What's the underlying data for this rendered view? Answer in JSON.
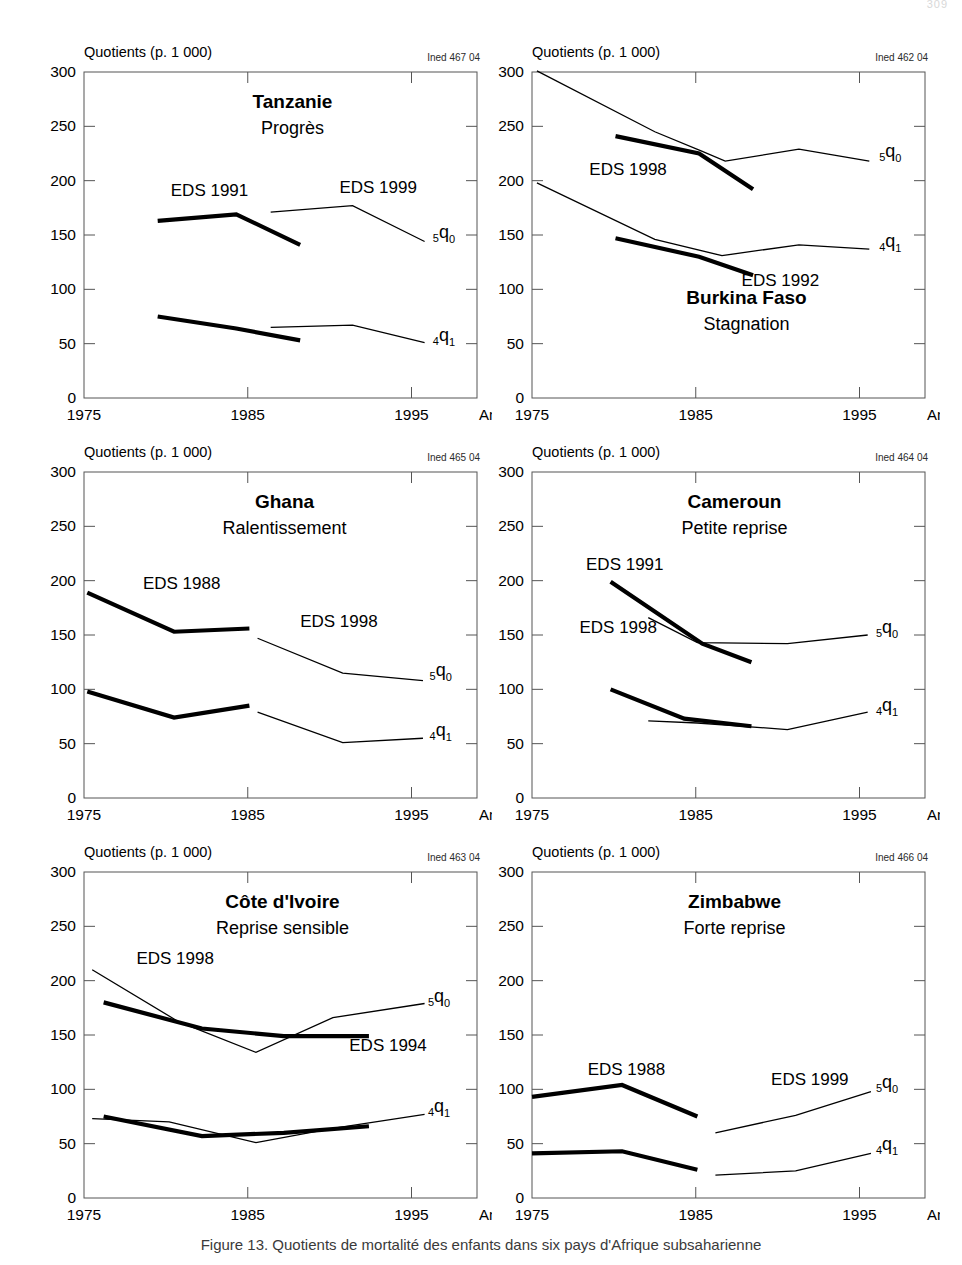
{
  "page": {
    "page_number": "309"
  },
  "caption": "Figure 13.  Quotients de mortalité des enfants dans six pays d'Afrique subsaharienne",
  "axis": {
    "y_axis_title": "Quotients (p. 1 000)",
    "x_axis_title": "Année",
    "y_ticks": [
      "0",
      "50",
      "100",
      "150",
      "200",
      "250",
      "300"
    ],
    "y_tick_values": [
      0,
      50,
      100,
      150,
      200,
      250,
      300
    ],
    "x_ticks": [
      "1975",
      "1985",
      "1995"
    ],
    "x_tick_values": [
      1975,
      1985,
      1995
    ],
    "xlim": [
      1975,
      1999
    ],
    "ylim": [
      0,
      300
    ]
  },
  "series_labels": {
    "q5": "5q0",
    "q4": "4q1"
  },
  "chart_data": [
    {
      "type": "line",
      "title": "Tanzanie",
      "subtitle": "Progrès",
      "ined_code": "Ined 467 04",
      "xlabel": "Année",
      "ylabel": "Quotients (p. 1 000)",
      "xlim": [
        1975,
        1999
      ],
      "ylim": [
        0,
        300
      ],
      "grid": false,
      "legend_position": "inline-annotations",
      "annotations": [
        {
          "text": "EDS 1991",
          "x": 1980.3,
          "y": 186
        },
        {
          "text": "EDS 1999",
          "x": 1990.6,
          "y": 189
        },
        {
          "text": "5q0",
          "x": 1996.3,
          "y": 147
        },
        {
          "text": "4q1",
          "x": 1996.3,
          "y": 52
        }
      ],
      "series": [
        {
          "name": "EDS 1991 — 5q0",
          "weight": "bold",
          "x": [
            1979.5,
            1984.3,
            1988.2
          ],
          "values": [
            163,
            169,
            141
          ]
        },
        {
          "name": "EDS 1991 — 4q1",
          "weight": "bold",
          "x": [
            1979.5,
            1984.3,
            1988.2
          ],
          "values": [
            75,
            64,
            53
          ]
        },
        {
          "name": "EDS 1999 — 5q0",
          "weight": "thin",
          "x": [
            1986.4,
            1991.4,
            1995.8
          ],
          "values": [
            171,
            177,
            144
          ]
        },
        {
          "name": "EDS 1999 — 4q1",
          "weight": "thin",
          "x": [
            1986.4,
            1991.4,
            1995.8
          ],
          "values": [
            65,
            67,
            51
          ]
        }
      ]
    },
    {
      "type": "line",
      "title": "Burkina Faso",
      "subtitle": "Stagnation",
      "ined_code": "Ined 462 04",
      "xlabel": "Année",
      "ylabel": "Quotients (p. 1 000)",
      "xlim": [
        1975,
        1999
      ],
      "ylim": [
        0,
        300
      ],
      "grid": false,
      "legend_position": "inline-annotations",
      "annotations": [
        {
          "text": "EDS 1998",
          "x": 1978.5,
          "y": 205
        },
        {
          "text": "EDS 1992",
          "x": 1987.8,
          "y": 103
        },
        {
          "text": "5q0",
          "x": 1996.2,
          "y": 222
        },
        {
          "text": "4q1",
          "x": 1996.2,
          "y": 139
        }
      ],
      "series": [
        {
          "name": "EDS 1998 — 5q0",
          "weight": "thin",
          "x": [
            1975.3,
            1982.5,
            1985.4,
            1986.8,
            1991.3,
            1995.6
          ],
          "values": [
            301,
            245,
            227,
            218,
            229,
            218
          ]
        },
        {
          "name": "EDS 1998 — 4q1",
          "weight": "thin",
          "x": [
            1975.3,
            1982.5,
            1986.6,
            1991.3,
            1995.6
          ],
          "values": [
            198,
            146,
            131,
            141,
            137
          ]
        },
        {
          "name": "EDS 1992 — 5q0",
          "weight": "bold",
          "x": [
            1980.1,
            1985.2,
            1988.5
          ],
          "values": [
            241,
            225,
            192
          ]
        },
        {
          "name": "EDS 1992 — 4q1",
          "weight": "bold",
          "x": [
            1980.1,
            1985.2,
            1988.5
          ],
          "values": [
            147,
            130,
            113
          ]
        }
      ]
    },
    {
      "type": "line",
      "title": "Ghana",
      "subtitle": "Ralentissement",
      "ined_code": "Ined 465 04",
      "xlabel": "Année",
      "ylabel": "Quotients (p. 1 000)",
      "xlim": [
        1975,
        1999
      ],
      "ylim": [
        0,
        300
      ],
      "grid": false,
      "legend_position": "inline-annotations",
      "annotations": [
        {
          "text": "EDS 1988",
          "x": 1978.6,
          "y": 192
        },
        {
          "text": "EDS 1998",
          "x": 1988.2,
          "y": 157
        },
        {
          "text": "5q0",
          "x": 1996.1,
          "y": 112
        },
        {
          "text": "4q1",
          "x": 1996.1,
          "y": 57
        }
      ],
      "series": [
        {
          "name": "EDS 1988 — 5q0",
          "weight": "bold",
          "x": [
            1975.2,
            1980.5,
            1985.1
          ],
          "values": [
            189,
            153,
            156
          ]
        },
        {
          "name": "EDS 1988 — 4q1",
          "weight": "bold",
          "x": [
            1975.2,
            1980.5,
            1985.1
          ],
          "values": [
            98,
            74,
            85
          ]
        },
        {
          "name": "EDS 1998 — 5q0",
          "weight": "thin",
          "x": [
            1985.6,
            1990.8,
            1995.7
          ],
          "values": [
            147,
            115,
            108
          ]
        },
        {
          "name": "EDS 1998 — 4q1",
          "weight": "thin",
          "x": [
            1985.6,
            1990.8,
            1995.7
          ],
          "values": [
            79,
            51,
            55
          ]
        }
      ]
    },
    {
      "type": "line",
      "title": "Cameroun",
      "subtitle": "Petite reprise",
      "ined_code": "Ined 464 04",
      "xlabel": "Année",
      "ylabel": "Quotients (p. 1 000)",
      "xlim": [
        1975,
        1999
      ],
      "ylim": [
        0,
        300
      ],
      "grid": false,
      "legend_position": "inline-annotations",
      "annotations": [
        {
          "text": "EDS 1991",
          "x": 1978.3,
          "y": 210
        },
        {
          "text": "EDS 1998",
          "x": 1977.9,
          "y": 152
        },
        {
          "text": "5q0",
          "x": 1996.0,
          "y": 152
        },
        {
          "text": "4q1",
          "x": 1996.0,
          "y": 80
        }
      ],
      "series": [
        {
          "name": "EDS 1991 — 5q0",
          "weight": "bold",
          "x": [
            1979.8,
            1985.4,
            1988.4
          ],
          "values": [
            199,
            142,
            125
          ]
        },
        {
          "name": "EDS 1991 — 4q1",
          "weight": "bold",
          "x": [
            1979.8,
            1984.3,
            1988.4
          ],
          "values": [
            100,
            73,
            66
          ]
        },
        {
          "name": "EDS 1998 — 5q0",
          "weight": "thin",
          "x": [
            1982.1,
            1985.1,
            1990.6,
            1995.5
          ],
          "values": [
            166,
            143,
            142,
            150
          ]
        },
        {
          "name": "EDS 1998 — 4q1",
          "weight": "thin",
          "x": [
            1982.1,
            1985.1,
            1990.6,
            1995.5
          ],
          "values": [
            71,
            69,
            63,
            79
          ]
        }
      ]
    },
    {
      "type": "line",
      "title": "Côte d'Ivoire",
      "subtitle": "Reprise sensible",
      "ined_code": "Ined 463 04",
      "xlabel": "Année",
      "ylabel": "Quotients (p. 1 000)",
      "xlim": [
        1975,
        1999
      ],
      "ylim": [
        0,
        300
      ],
      "grid": false,
      "legend_position": "inline-annotations",
      "annotations": [
        {
          "text": "EDS 1998",
          "x": 1978.2,
          "y": 215
        },
        {
          "text": "EDS 1994",
          "x": 1991.2,
          "y": 135
        },
        {
          "text": "5q0",
          "x": 1996.0,
          "y": 180
        },
        {
          "text": "4q1",
          "x": 1996.0,
          "y": 79
        }
      ],
      "series": [
        {
          "name": "EDS 1998 — 5q0",
          "weight": "thin",
          "x": [
            1975.5,
            1980.8,
            1985.5,
            1990.2,
            1995.8
          ],
          "values": [
            210,
            162,
            134,
            166,
            179
          ]
        },
        {
          "name": "EDS 1998 — 4q1",
          "weight": "thin",
          "x": [
            1975.5,
            1980.2,
            1985.5,
            1990.2,
            1995.8
          ],
          "values": [
            73,
            70,
            51,
            64,
            77
          ]
        },
        {
          "name": "EDS 1994 — 5q0",
          "weight": "bold",
          "x": [
            1976.2,
            1982.2,
            1987.2,
            1992.4
          ],
          "values": [
            180,
            156,
            149,
            149
          ]
        },
        {
          "name": "EDS 1994 — 4q1",
          "weight": "bold",
          "x": [
            1976.2,
            1982.2,
            1987.2,
            1992.4
          ],
          "values": [
            75,
            57,
            60,
            66
          ]
        }
      ]
    },
    {
      "type": "line",
      "title": "Zimbabwe",
      "subtitle": "Forte reprise",
      "ined_code": "Ined 466 04",
      "xlabel": "Année",
      "ylabel": "Quotients (p. 1 000)",
      "xlim": [
        1975,
        1999
      ],
      "ylim": [
        0,
        300
      ],
      "grid": false,
      "legend_position": "inline-annotations",
      "annotations": [
        {
          "text": "EDS 1988",
          "x": 1978.4,
          "y": 113
        },
        {
          "text": "EDS 1999",
          "x": 1989.6,
          "y": 104
        },
        {
          "text": "5q0",
          "x": 1996.0,
          "y": 101
        },
        {
          "text": "4q1",
          "x": 1996.0,
          "y": 44
        }
      ],
      "series": [
        {
          "name": "EDS 1988 — 5q0",
          "weight": "bold",
          "x": [
            1975.0,
            1980.5,
            1985.1
          ],
          "values": [
            93,
            104,
            75
          ]
        },
        {
          "name": "EDS 1988 — 4q1",
          "weight": "bold",
          "x": [
            1975.0,
            1980.5,
            1985.1
          ],
          "values": [
            41,
            43,
            26
          ]
        },
        {
          "name": "EDS 1999 — 5q0",
          "weight": "thin",
          "x": [
            1986.2,
            1991.1,
            1995.7
          ],
          "values": [
            60,
            76,
            98
          ]
        },
        {
          "name": "EDS 1999 — 4q1",
          "weight": "thin",
          "x": [
            1986.2,
            1991.1,
            1995.7
          ],
          "values": [
            21,
            25,
            41
          ]
        }
      ]
    }
  ]
}
